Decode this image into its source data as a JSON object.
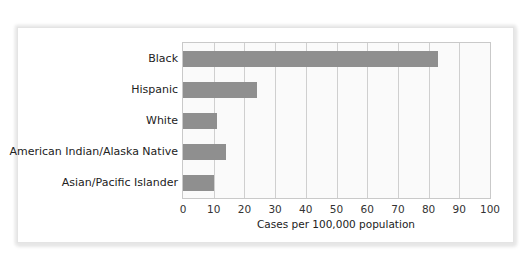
{
  "chart_data": {
    "type": "bar",
    "orientation": "horizontal",
    "title": "",
    "categories": [
      "Black",
      "Hispanic",
      "White",
      "American Indian/Alaska Native",
      "Asian/Pacific Islander"
    ],
    "values": [
      83,
      24,
      11,
      14,
      10
    ],
    "xlabel": "Cases per 100,000 population",
    "ylabel": "",
    "xlim": [
      0,
      100
    ],
    "xticks": [
      "0",
      "10",
      "20",
      "30",
      "40",
      "50",
      "60",
      "70",
      "80",
      "90",
      "100"
    ],
    "grid": true,
    "legend": null,
    "bar_color": "#8f8f8f"
  }
}
